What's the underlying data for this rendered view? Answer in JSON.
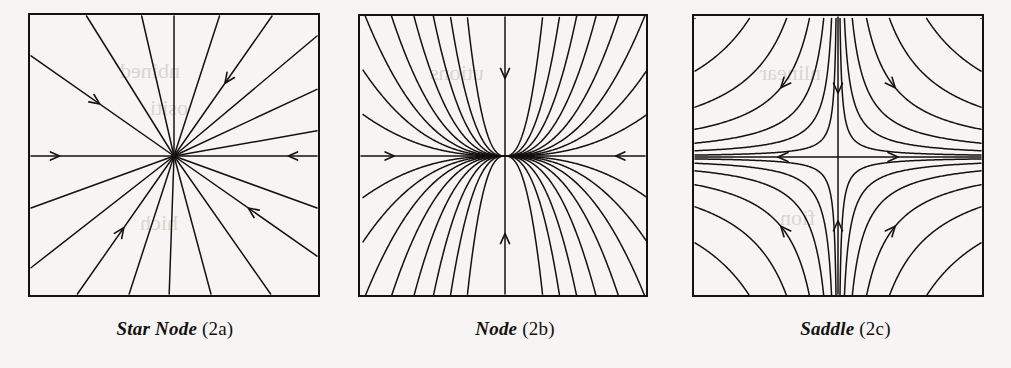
{
  "figure": {
    "background_color": "#f6f5f3",
    "ink_color": "#14110f"
  },
  "panels": [
    {
      "id": "star-node",
      "caption_name": "Star Node",
      "caption_tag": "(2c-placeholder)",
      "box": {
        "x": 28,
        "y": 13,
        "width": 292,
        "height": 284
      },
      "center": {
        "x": 146,
        "y": 143
      },
      "flow": "radial-inward",
      "ray_angles_deg": [
        0,
        10,
        25,
        40,
        55,
        72,
        90,
        103,
        122,
        145,
        180,
        200,
        218,
        235,
        252,
        268,
        285,
        305,
        325,
        340
      ],
      "arrow_count": 4,
      "arrow_direction": "inward"
    },
    {
      "id": "node",
      "caption_name": "Node",
      "caption_tag": "(2b)",
      "box": {
        "x": 358,
        "y": 14,
        "width": 290,
        "height": 283
      },
      "center": {
        "x": 147,
        "y": 142
      },
      "flow": "node-inward-tangent-horizontal",
      "arrow_count": 6,
      "arrow_direction": "inward"
    },
    {
      "id": "saddle",
      "caption_name": "Saddle",
      "caption_tag": "(2c)",
      "box": {
        "x": 692,
        "y": 14,
        "width": 292,
        "height": 283
      },
      "center": {
        "x": 146,
        "y": 143
      },
      "flow": "hyperbolic",
      "stable_axis": "vertical",
      "unstable_axis": "horizontal",
      "arrow_count": 6
    }
  ],
  "captions": [
    {
      "name": "Star Node",
      "tag": "(2a)"
    },
    {
      "name": "Node",
      "tag": "(2b)"
    },
    {
      "name": "Saddle",
      "tag": "(2c)"
    }
  ],
  "bleedthrough_text": [
    "nbined",
    "ositi",
    "hich",
    "utions",
    "nlinear",
    "fion"
  ]
}
